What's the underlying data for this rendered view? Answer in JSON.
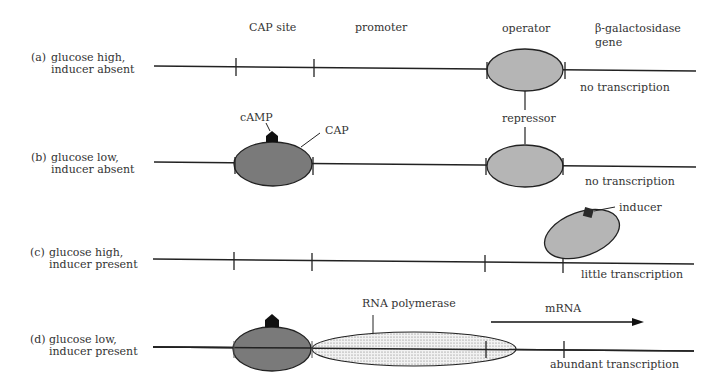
{
  "headers": {
    "cap_site": "CAP site",
    "promoter": "promoter",
    "operator": "operator",
    "gene_line1": "β-galactosidase",
    "gene_line2": "gene"
  },
  "rows": [
    {
      "tag": "(a)",
      "line1": "glucose high,",
      "line2": "inducer absent",
      "result": "no transcription"
    },
    {
      "tag": "(b)",
      "line1": "glucose low,",
      "line2": "inducer absent",
      "result": "no transcription"
    },
    {
      "tag": "(c)",
      "line1": "glucose high,",
      "line2": "inducer present",
      "result": "little transcription"
    },
    {
      "tag": "(d)",
      "line1": "glucose low,",
      "line2": "inducer present",
      "result": "abundant transcription"
    }
  ],
  "labels": {
    "camp": "cAMP",
    "cap": "CAP",
    "repressor": "repressor",
    "inducer": "inducer",
    "rna_polymerase": "RNA polymerase",
    "mrna": "mRNA"
  },
  "colors": {
    "cap_fill": "#7a7a7a",
    "repressor_fill": "#b5b5b5",
    "line": "#222222"
  }
}
